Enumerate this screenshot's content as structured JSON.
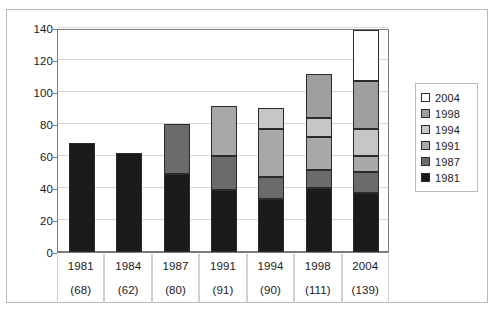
{
  "chart_data": {
    "type": "bar",
    "title": "",
    "subtitle": "",
    "xlabel": "",
    "ylabel": "",
    "stacked": true,
    "grid": true,
    "legend_position": "right",
    "ylim": [
      0,
      140
    ],
    "yticks": [
      0,
      20,
      40,
      60,
      80,
      100,
      120,
      140
    ],
    "categories": [
      "1981",
      "1984",
      "1987",
      "1991",
      "1994",
      "1998",
      "2004"
    ],
    "category_totals": [
      "(68)",
      "(62)",
      "(80)",
      "(91)",
      "(90)",
      "(111)",
      "(139)"
    ],
    "totals": [
      68,
      62,
      80,
      91,
      90,
      111,
      139
    ],
    "series": [
      {
        "name": "1981",
        "color": "#1a1a1a",
        "values": [
          68,
          62,
          49,
          39,
          33,
          40,
          37
        ]
      },
      {
        "name": "1987",
        "color": "#6b6b6b",
        "values": [
          0,
          0,
          31,
          21,
          14,
          11,
          13
        ]
      },
      {
        "name": "1991",
        "color": "#a8a8a8",
        "values": [
          0,
          0,
          0,
          31,
          30,
          21,
          10
        ]
      },
      {
        "name": "1994",
        "color": "#c6c6c6",
        "values": [
          0,
          0,
          0,
          0,
          13,
          12,
          17
        ]
      },
      {
        "name": "1998",
        "color": "#9e9e9e",
        "values": [
          0,
          0,
          0,
          0,
          0,
          27,
          30
        ]
      },
      {
        "name": "2004",
        "color": "#ffffff",
        "values": [
          0,
          0,
          0,
          0,
          0,
          0,
          32
        ]
      }
    ],
    "legend_entries": [
      {
        "label": "2004",
        "color": "#ffffff"
      },
      {
        "label": "1998",
        "color": "#9e9e9e"
      },
      {
        "label": "1994",
        "color": "#c6c6c6"
      },
      {
        "label": "1991",
        "color": "#a8a8a8"
      },
      {
        "label": "1987",
        "color": "#6b6b6b"
      },
      {
        "label": "1981",
        "color": "#1a1a1a"
      }
    ]
  }
}
